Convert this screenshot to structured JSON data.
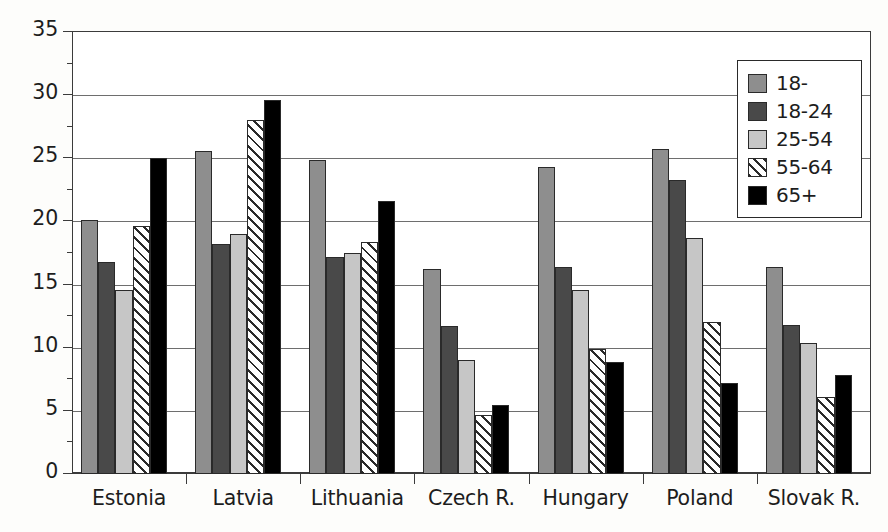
{
  "chart_data": {
    "type": "bar",
    "title": "",
    "subtitle": "",
    "xlabel": "",
    "ylabel": "",
    "ylim": [
      0,
      35
    ],
    "ytick_labels": [
      "0",
      "5",
      "10",
      "15",
      "20",
      "25",
      "30",
      "35"
    ],
    "ytick_values": [
      0,
      5,
      10,
      15,
      20,
      25,
      30,
      35
    ],
    "yminor_values": [
      2.5,
      7.5,
      12.5,
      17.5,
      22.5,
      27.5,
      32.5
    ],
    "grid": "horizontal",
    "legend_position": "top-right",
    "categories": [
      "Estonia",
      "Latvia",
      "Lithuania",
      "Czech R.",
      "Hungary",
      "Poland",
      "Slovak R."
    ],
    "series": [
      {
        "name": "18-",
        "color": "#8e8e8e",
        "pattern": "solid",
        "values": [
          20.1,
          25.6,
          24.9,
          16.2,
          24.3,
          25.7,
          16.4
        ]
      },
      {
        "name": "18-24",
        "color": "#494949",
        "pattern": "solid",
        "values": [
          16.8,
          18.2,
          17.2,
          11.7,
          16.4,
          23.3,
          11.8
        ]
      },
      {
        "name": "25-54",
        "color": "#c6c6c6",
        "pattern": "solid",
        "values": [
          14.6,
          19.0,
          17.5,
          9.0,
          14.6,
          18.7,
          10.4
        ]
      },
      {
        "name": "55-64",
        "color": "#ffffff",
        "pattern": "diagonal-hatch",
        "values": [
          19.6,
          28.0,
          18.4,
          4.7,
          9.9,
          12.0,
          6.1
        ]
      },
      {
        "name": "65+",
        "color": "#000000",
        "pattern": "solid",
        "values": [
          25.0,
          29.6,
          21.6,
          5.5,
          8.9,
          7.2,
          7.8
        ]
      }
    ]
  },
  "legend": {
    "items": [
      {
        "label": "18-"
      },
      {
        "label": "18-24"
      },
      {
        "label": "25-54"
      },
      {
        "label": "55-64"
      },
      {
        "label": "65+"
      }
    ]
  }
}
